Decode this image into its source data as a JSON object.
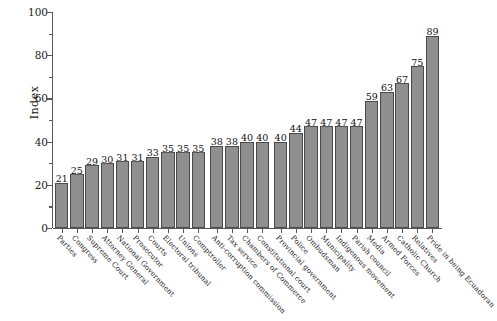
{
  "chart_data": {
    "type": "bar",
    "title": "",
    "xlabel": "",
    "ylabel": "Index",
    "ylim": [
      0,
      100
    ],
    "yticks": [
      0,
      20,
      40,
      60,
      80,
      100
    ],
    "ytick_labels": [
      "0",
      "20",
      "40",
      "60",
      "80",
      "100"
    ],
    "grid": false,
    "legend": null,
    "orientation": "vertical",
    "bar_color": "#8f8f8f",
    "bar_edge_color": "#4a4a4a",
    "data_labels_shown": true,
    "group_breaks_after": [
      10,
      14
    ],
    "categories": [
      "Parties",
      "Congress",
      "Supreme Court",
      "Attorney General",
      "National Government",
      "Prosecutor",
      "Courts",
      "Electoral tribunal",
      "Unions",
      "Comptroller",
      "Anti-corruption commission",
      "Tax service",
      "Chambers of Commerce",
      "Constitutional court",
      "Provincial government",
      "Police",
      "Ombudsman",
      "Municipality",
      "Indigenous movement",
      "Parish council",
      "Media",
      "Armed Forces",
      "Catholic Church",
      "Relatives",
      "Pride in being Ecuadoran"
    ],
    "values": [
      21,
      25,
      29,
      30,
      31,
      31,
      33,
      35,
      35,
      35,
      38,
      38,
      40,
      40,
      40,
      44,
      47,
      47,
      47,
      47,
      59,
      63,
      67,
      75,
      89
    ],
    "value_labels": [
      "21",
      "25",
      "29",
      "30",
      "31",
      "31",
      "33",
      "35",
      "35",
      "35",
      "38",
      "38",
      "40",
      "40",
      "40",
      "44",
      "47",
      "47",
      "47",
      "47",
      "59",
      "63",
      "67",
      "75",
      "89"
    ]
  }
}
